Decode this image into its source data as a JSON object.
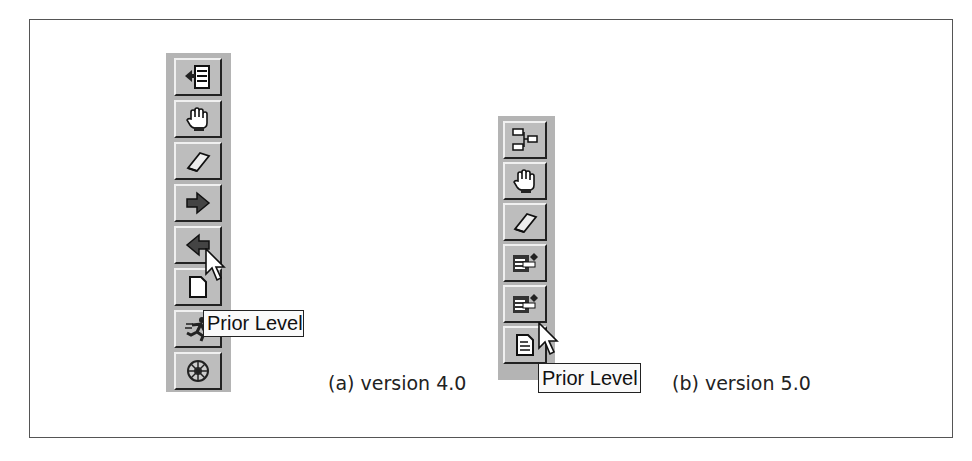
{
  "figure": {
    "toolbar_a": {
      "caption": "(a) version 4.0",
      "buttons": [
        {
          "icon": "indent-list-icon"
        },
        {
          "icon": "hand-icon"
        },
        {
          "icon": "eraser-icon"
        },
        {
          "icon": "arrow-right-icon"
        },
        {
          "icon": "arrow-left-icon"
        },
        {
          "icon": "page-icon"
        },
        {
          "icon": "running-figure-icon"
        },
        {
          "icon": "wheel-icon"
        }
      ],
      "tooltip": "Prior Level",
      "hovered_button_index": 4
    },
    "toolbar_b": {
      "caption": "(b) version 5.0",
      "buttons": [
        {
          "icon": "outline-collapse-icon"
        },
        {
          "icon": "hand-icon"
        },
        {
          "icon": "eraser-icon"
        },
        {
          "icon": "folder-next-level-icon"
        },
        {
          "icon": "folder-prior-level-icon"
        },
        {
          "icon": "document-icon"
        }
      ],
      "tooltip": "Prior Level",
      "hovered_button_index": 4
    },
    "colors": {
      "toolbar_bg": "#b4b4b4",
      "button_face": "#bdbdbd",
      "tooltip_bg": "#fafafa",
      "frame_border": "#555555"
    }
  }
}
